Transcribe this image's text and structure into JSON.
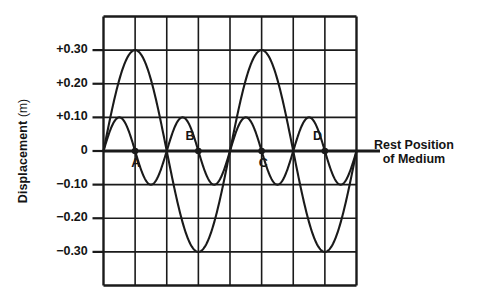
{
  "figure": {
    "y_axis_title_main": "Displacement",
    "y_axis_title_unit": "(m)",
    "rest_label_line1": "Rest Position",
    "rest_label_line2": "of Medium",
    "ink_color": "#1a1a1a",
    "background_color": "#ffffff"
  },
  "chart_data": {
    "type": "line",
    "title": "",
    "xlabel": "",
    "ylabel": "Displacement (m)",
    "ylim": [
      -0.4,
      0.4
    ],
    "xlim": [
      0,
      8
    ],
    "grid": true,
    "grid_columns": 8,
    "grid_rows": 8,
    "y_tick_labels": [
      "+0.30",
      "+0.20",
      "+0.10",
      "0",
      "−0.10",
      "−0.20",
      "−0.30"
    ],
    "y_tick_values": [
      0.3,
      0.2,
      0.1,
      0,
      -0.1,
      -0.2,
      -0.3
    ],
    "x_tick_labels": [],
    "legend": [],
    "annotations": [
      {
        "label": "A",
        "x": 1,
        "y": 0
      },
      {
        "label": "B",
        "x": 3,
        "y": 0
      },
      {
        "label": "C",
        "x": 5,
        "y": 0
      },
      {
        "label": "D",
        "x": 7,
        "y": 0
      }
    ],
    "series": [
      {
        "name": "small-amplitude wave",
        "amplitude": 0.1,
        "wavelength": 2,
        "phase": 0,
        "x_start": 0,
        "x_end": 8,
        "description": "sine wave, amplitude 0.10 m, wavelength 2 divisions"
      },
      {
        "name": "large-amplitude wave",
        "amplitude": 0.3,
        "wavelength": 4,
        "phase": 0,
        "x_start": 0,
        "x_end": 8,
        "description": "sine wave, amplitude 0.30 m, wavelength 4 divisions"
      }
    ]
  }
}
